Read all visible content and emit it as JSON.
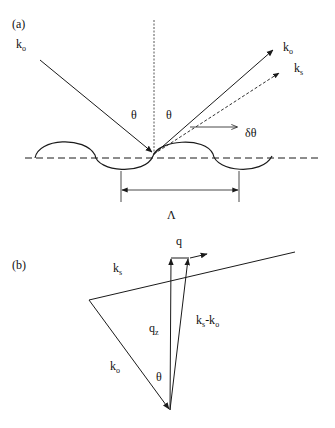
{
  "panels": {
    "a": {
      "label": "(a)",
      "incident_wave": "k",
      "incident_wave_sub": "o",
      "reflected_wave": "k",
      "reflected_wave_sub": "o",
      "scattered_wave": "k",
      "scattered_wave_sub": "s",
      "angle_incident": "θ",
      "angle_reflected": "θ",
      "angle_deviation": "δθ",
      "period": "Λ"
    },
    "b": {
      "label": "(b)",
      "scattered_vector": "k",
      "scattered_vector_sub": "s",
      "incident_vector": "k",
      "incident_vector_sub": "o",
      "normal_component": "q",
      "normal_component_sub": "z",
      "difference_vector": "k",
      "difference_vector_sub": "s",
      "difference_vector_mid": "-k",
      "difference_vector_sub2": "o",
      "parallel_component": "q",
      "angle": "θ"
    }
  },
  "colors": {
    "stroke": "#1a1a1a",
    "background": "#ffffff"
  }
}
